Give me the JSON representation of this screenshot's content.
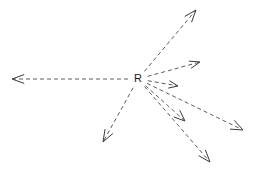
{
  "figure": {
    "width": 257,
    "height": 172,
    "background_color": "#ffffff"
  },
  "center_point": {
    "label": "R",
    "x": 138,
    "y": 79,
    "font_size": 11,
    "color": "#1a1a1a"
  },
  "style": {
    "line_color": "#4a4a4a",
    "arrow_color": "#3a3a3a",
    "line_width": 0.9,
    "arrow_width": 1.0,
    "dash_pattern": "4,3"
  },
  "rays": [
    {
      "name": "ray-left",
      "direction": "left",
      "from_x": 138,
      "from_y": 79,
      "to_x": 12,
      "to_y": 79,
      "angle_deg": 180,
      "head_size": 13,
      "head_spread_deg": 20
    },
    {
      "name": "ray-upper-right-steep",
      "direction": "upper-right-steep",
      "from_x": 138,
      "from_y": 79,
      "to_x": 196,
      "to_y": 10,
      "angle_deg": 50,
      "head_size": 13,
      "head_spread_deg": 20
    },
    {
      "name": "ray-upper-right-shallow",
      "direction": "upper-right-shallow",
      "from_x": 138,
      "from_y": 79,
      "to_x": 200,
      "to_y": 62,
      "angle_deg": 15,
      "head_size": 11,
      "head_spread_deg": 20
    },
    {
      "name": "ray-right",
      "direction": "right",
      "from_x": 138,
      "from_y": 79,
      "to_x": 178,
      "to_y": 86,
      "angle_deg": -10,
      "head_size": 10,
      "head_spread_deg": 22
    },
    {
      "name": "ray-lower-right-far",
      "direction": "lower-right-far",
      "from_x": 138,
      "from_y": 79,
      "to_x": 243,
      "to_y": 130,
      "angle_deg": -26,
      "head_size": 13,
      "head_spread_deg": 22
    },
    {
      "name": "ray-lower-right-mid",
      "direction": "lower-right-mid",
      "from_x": 138,
      "from_y": 79,
      "to_x": 185,
      "to_y": 121,
      "angle_deg": -42,
      "head_size": 12,
      "head_spread_deg": 22
    },
    {
      "name": "ray-lower-right-steep",
      "direction": "lower-right-steep",
      "from_x": 138,
      "from_y": 79,
      "to_x": 210,
      "to_y": 162,
      "angle_deg": -48,
      "head_size": 13,
      "head_spread_deg": 20
    },
    {
      "name": "ray-lower-left",
      "direction": "lower-left",
      "from_x": 138,
      "from_y": 79,
      "to_x": 103,
      "to_y": 142,
      "angle_deg": -119,
      "head_size": 13,
      "head_spread_deg": 20
    }
  ]
}
